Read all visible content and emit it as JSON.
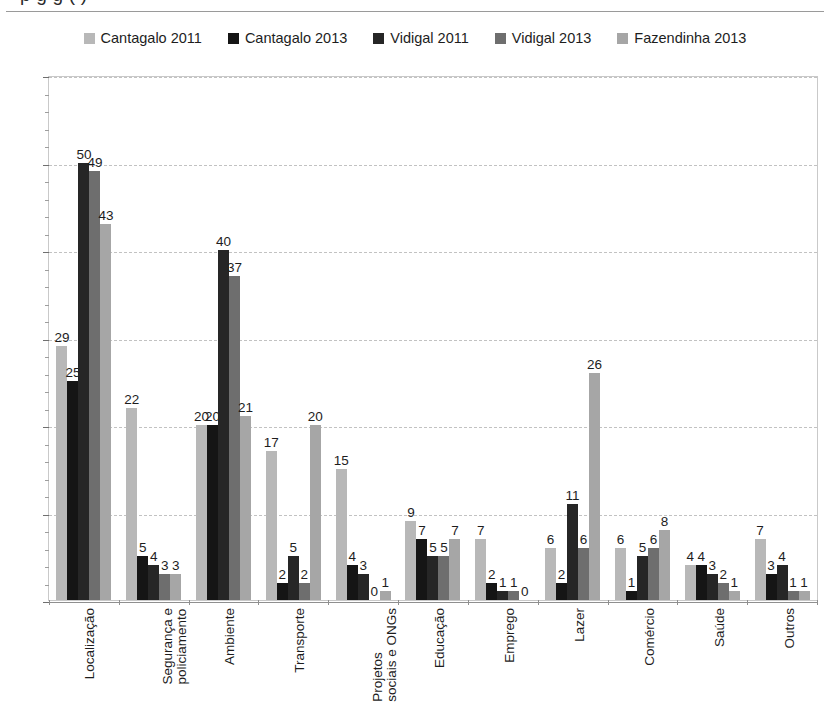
{
  "title_partial": "p        g        g    (  )",
  "legend": {
    "items": [
      {
        "label": "Cantagalo 2011",
        "color": "#b8b8b8"
      },
      {
        "label": "Cantagalo 2013",
        "color": "#151515"
      },
      {
        "label": "Vidigal 2011",
        "color": "#262626"
      },
      {
        "label": "Vidigal 2013",
        "color": "#6e6e6e"
      },
      {
        "label": "Fazendinha 2013",
        "color": "#a6a6a6"
      }
    ]
  },
  "chart_data": {
    "type": "bar",
    "title": "",
    "xlabel": "",
    "ylabel": "",
    "ylim": [
      0,
      60
    ],
    "ytick_step": 10,
    "yticks": [
      0,
      10,
      20,
      30,
      40,
      50,
      60
    ],
    "grid": true,
    "legend_position": "top-center",
    "categories": [
      "Localização",
      "Segurança e policiamento",
      "Ambiente",
      "Transporte",
      "Projetos sociais e ONGs",
      "Educação",
      "Emprego",
      "Lazer",
      "Comércio",
      "Saúde",
      "Outros"
    ],
    "category_lines": [
      [
        "Localização"
      ],
      [
        "Segurança e",
        "policiamento"
      ],
      [
        "Ambiente"
      ],
      [
        "Transporte"
      ],
      [
        "Projetos",
        "sociais e ONGs"
      ],
      [
        "Educação"
      ],
      [
        "Emprego"
      ],
      [
        "Lazer"
      ],
      [
        "Comércio"
      ],
      [
        "Saúde"
      ],
      [
        "Outros"
      ]
    ],
    "series": [
      {
        "name": "Cantagalo 2011",
        "color": "#b8b8b8",
        "values": [
          29,
          22,
          20,
          17,
          15,
          9,
          7,
          6,
          6,
          4,
          7
        ]
      },
      {
        "name": "Cantagalo 2013",
        "color": "#151515",
        "values": [
          25,
          5,
          20,
          2,
          4,
          7,
          2,
          2,
          1,
          4,
          3
        ]
      },
      {
        "name": "Vidigal 2011",
        "color": "#262626",
        "values": [
          50,
          4,
          40,
          5,
          3,
          5,
          1,
          11,
          5,
          3,
          4
        ]
      },
      {
        "name": "Vidigal 2013",
        "color": "#6e6e6e",
        "values": [
          49,
          3,
          37,
          2,
          0,
          5,
          1,
          6,
          6,
          2,
          1
        ]
      },
      {
        "name": "Fazendinha 2013",
        "color": "#a6a6a6",
        "values": [
          43,
          3,
          21,
          20,
          1,
          7,
          0,
          26,
          8,
          1,
          1
        ]
      }
    ]
  }
}
